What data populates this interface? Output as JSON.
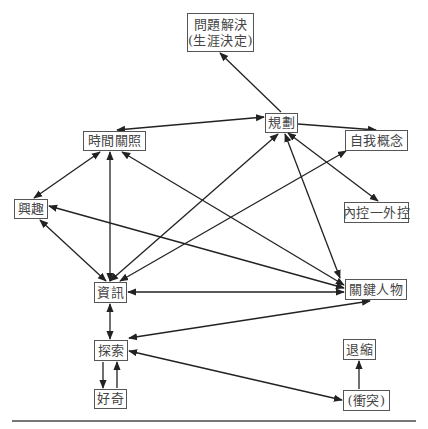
{
  "diagram": {
    "nodes": [
      {
        "id": "problem_solving",
        "lines": [
          "問題解決",
          "(生涯決定)"
        ],
        "x": 187,
        "y": 13,
        "w": 67,
        "h": 39
      },
      {
        "id": "planning",
        "lines": [
          "規劃"
        ],
        "x": 265,
        "y": 113,
        "w": 33,
        "h": 20
      },
      {
        "id": "time_perspective",
        "lines": [
          "時間關照"
        ],
        "x": 83,
        "y": 131,
        "w": 63,
        "h": 20
      },
      {
        "id": "self_concept",
        "lines": [
          "自我概念"
        ],
        "x": 345,
        "y": 130,
        "w": 63,
        "h": 21
      },
      {
        "id": "interest",
        "lines": [
          "興趣"
        ],
        "x": 14,
        "y": 199,
        "w": 34,
        "h": 20
      },
      {
        "id": "locus_of_control",
        "lines": [
          "內控一外控"
        ],
        "x": 344,
        "y": 202,
        "w": 65,
        "h": 21
      },
      {
        "id": "information",
        "lines": [
          "資訊"
        ],
        "x": 94,
        "y": 282,
        "w": 33,
        "h": 21
      },
      {
        "id": "key_persons",
        "lines": [
          "關鍵人物"
        ],
        "x": 345,
        "y": 279,
        "w": 62,
        "h": 21
      },
      {
        "id": "exploration",
        "lines": [
          "探索"
        ],
        "x": 94,
        "y": 340,
        "w": 34,
        "h": 21
      },
      {
        "id": "curiosity",
        "lines": [
          "好奇"
        ],
        "x": 94,
        "y": 389,
        "w": 33,
        "h": 20
      },
      {
        "id": "withdrawal",
        "lines": [
          "退縮"
        ],
        "x": 343,
        "y": 339,
        "w": 33,
        "h": 21
      },
      {
        "id": "conflict",
        "lines": [
          "(衝突)"
        ],
        "x": 343,
        "y": 390,
        "w": 47,
        "h": 21
      }
    ],
    "edges": [
      {
        "from": "planning",
        "to": "problem_solving",
        "x1": 281,
        "y1": 112,
        "x2": 220,
        "y2": 53,
        "start_arrow": false,
        "end_arrow": true
      },
      {
        "from": "planning",
        "to": "time_perspective",
        "x1": 264,
        "y1": 117,
        "x2": 117,
        "y2": 130,
        "start_arrow": true,
        "end_arrow": true
      },
      {
        "from": "planning",
        "to": "self_concept",
        "x1": 298,
        "y1": 124,
        "x2": 376,
        "y2": 130,
        "start_arrow": false,
        "end_arrow": true
      },
      {
        "from": "planning",
        "to": "locus_of_control",
        "x1": 288,
        "y1": 133,
        "x2": 378,
        "y2": 201,
        "start_arrow": true,
        "end_arrow": true
      },
      {
        "from": "key_persons",
        "to": "planning",
        "x1": 340,
        "y1": 278,
        "x2": 285,
        "y2": 134,
        "start_arrow": true,
        "end_arrow": true
      },
      {
        "from": "information",
        "to": "planning",
        "x1": 110,
        "y1": 281,
        "x2": 278,
        "y2": 134,
        "start_arrow": true,
        "end_arrow": true
      },
      {
        "from": "time_perspective",
        "to": "interest",
        "x1": 100,
        "y1": 152,
        "x2": 34,
        "y2": 198,
        "start_arrow": true,
        "end_arrow": true
      },
      {
        "from": "time_perspective",
        "to": "information",
        "x1": 110,
        "y1": 152,
        "x2": 110,
        "y2": 281,
        "start_arrow": true,
        "end_arrow": true
      },
      {
        "from": "time_perspective",
        "to": "key_persons",
        "x1": 122,
        "y1": 152,
        "x2": 344,
        "y2": 285,
        "start_arrow": true,
        "end_arrow": true
      },
      {
        "from": "interest",
        "to": "information",
        "x1": 40,
        "y1": 220,
        "x2": 106,
        "y2": 281,
        "start_arrow": true,
        "end_arrow": true
      },
      {
        "from": "interest",
        "to": "key_persons",
        "x1": 49,
        "y1": 206,
        "x2": 344,
        "y2": 288,
        "start_arrow": true,
        "end_arrow": true
      },
      {
        "from": "information",
        "to": "self_concept",
        "x1": 120,
        "y1": 281,
        "x2": 346,
        "y2": 151,
        "start_arrow": true,
        "end_arrow": true
      },
      {
        "from": "information",
        "to": "key_persons",
        "x1": 128,
        "y1": 292,
        "x2": 344,
        "y2": 292,
        "start_arrow": true,
        "end_arrow": true
      },
      {
        "from": "information",
        "to": "exploration",
        "x1": 110,
        "y1": 304,
        "x2": 110,
        "y2": 339,
        "start_arrow": true,
        "end_arrow": true
      },
      {
        "from": "exploration",
        "to": "key_persons",
        "x1": 129,
        "y1": 338,
        "x2": 370,
        "y2": 301,
        "start_arrow": true,
        "end_arrow": true
      },
      {
        "from": "exploration",
        "to": "conflict",
        "x1": 129,
        "y1": 351,
        "x2": 342,
        "y2": 400,
        "start_arrow": true,
        "end_arrow": true
      },
      {
        "from": "exploration",
        "to": "curiosity",
        "x1": 103,
        "y1": 362,
        "x2": 103,
        "y2": 388,
        "start_arrow": false,
        "end_arrow": true
      },
      {
        "from": "curiosity",
        "to": "exploration",
        "x1": 117,
        "y1": 388,
        "x2": 117,
        "y2": 362,
        "start_arrow": false,
        "end_arrow": true
      },
      {
        "from": "conflict",
        "to": "withdrawal",
        "x1": 359,
        "y1": 389,
        "x2": 359,
        "y2": 361,
        "start_arrow": false,
        "end_arrow": true
      }
    ],
    "colors": {
      "line": "#222222",
      "border": "#555555",
      "text": "#444444",
      "rule": "#777777"
    }
  }
}
